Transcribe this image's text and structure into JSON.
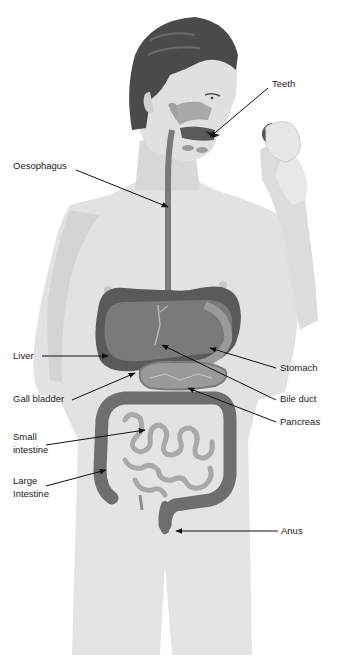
{
  "diagram": {
    "type": "labeled anatomical illustration",
    "labels": [
      {
        "id": "teeth",
        "text": "Teeth"
      },
      {
        "id": "oesophagus",
        "text": "Oesophagus"
      },
      {
        "id": "liver",
        "text": "Liver"
      },
      {
        "id": "stomach",
        "text": "Stomach"
      },
      {
        "id": "gall_bladder",
        "text": "Gall bladder"
      },
      {
        "id": "bile_duct",
        "text": "Bile duct"
      },
      {
        "id": "pancreas",
        "text": "Pancreas"
      },
      {
        "id": "small_intestine_1",
        "text": "Small"
      },
      {
        "id": "small_intestine_2",
        "text": "intestine"
      },
      {
        "id": "large_intestine_1",
        "text": "Large"
      },
      {
        "id": "large_intestine_2",
        "text": "Intestine"
      },
      {
        "id": "anus",
        "text": "Anus"
      }
    ]
  },
  "colors": {
    "skin": "#e2e2e2",
    "skin_shade": "#cfcfcf",
    "hair": "#4a4a4a",
    "organ_dark": "#555555",
    "organ_mid": "#7a7a7a",
    "organ_light": "#9e9e9e",
    "label_text": "#222222",
    "arrow": "#111111"
  }
}
